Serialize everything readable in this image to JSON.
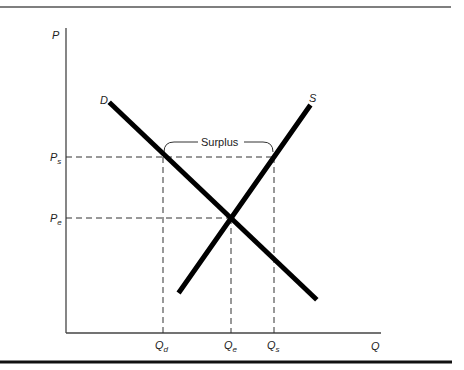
{
  "diagram": {
    "axes": {
      "y_label": "P",
      "x_label": "Q"
    },
    "curves": [
      {
        "name": "demand",
        "label": "D"
      },
      {
        "name": "supply",
        "label": "S"
      }
    ],
    "price_levels": [
      {
        "id": "ps",
        "main": "P",
        "sub": "s"
      },
      {
        "id": "pe",
        "main": "P",
        "sub": "e"
      }
    ],
    "quantity_levels": [
      {
        "id": "qd",
        "main": "Q",
        "sub": "d"
      },
      {
        "id": "qe",
        "main": "Q",
        "sub": "e"
      },
      {
        "id": "qs",
        "main": "Q",
        "sub": "s"
      }
    ],
    "annotation": {
      "surplus_label": "Surplus"
    },
    "colors": {
      "lines": "#000000",
      "axes": "#444444",
      "dashed": "#333333"
    }
  }
}
